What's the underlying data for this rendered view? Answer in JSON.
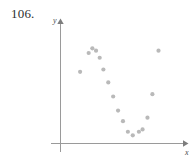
{
  "figure": {
    "problem_number": "106.",
    "axes": {
      "x_label": "x",
      "y_label": "y",
      "x_axis_color": "#9a9a9a",
      "y_axis_color": "#9a9a9a"
    },
    "point_color": "#b9b9b9"
  },
  "chart_data": {
    "type": "scatter",
    "title": "",
    "subtitle": "",
    "xlabel": "x",
    "ylabel": "y",
    "grid": false,
    "legend": null,
    "annotations": [
      "106."
    ],
    "axis_style": "arrowed-cartesian-axes-no-ticks",
    "xlim": [
      0,
      10
    ],
    "ylim": [
      0,
      10
    ],
    "series": [
      {
        "name": "data",
        "marker": "filled-circle",
        "color": "#b9b9b9",
        "points": [
          {
            "x": 1.6,
            "y": 6.1
          },
          {
            "x": 2.3,
            "y": 7.7
          },
          {
            "x": 2.6,
            "y": 8.1
          },
          {
            "x": 2.9,
            "y": 7.9
          },
          {
            "x": 3.2,
            "y": 7.3
          },
          {
            "x": 3.5,
            "y": 6.3
          },
          {
            "x": 3.9,
            "y": 5.2
          },
          {
            "x": 4.3,
            "y": 4.0
          },
          {
            "x": 4.7,
            "y": 2.8
          },
          {
            "x": 5.1,
            "y": 1.9
          },
          {
            "x": 5.5,
            "y": 1.0
          },
          {
            "x": 5.9,
            "y": 0.7
          },
          {
            "x": 6.4,
            "y": 1.0
          },
          {
            "x": 6.7,
            "y": 1.2
          },
          {
            "x": 7.1,
            "y": 2.2
          },
          {
            "x": 7.5,
            "y": 4.2
          },
          {
            "x": 8.0,
            "y": 7.9
          }
        ]
      }
    ]
  }
}
